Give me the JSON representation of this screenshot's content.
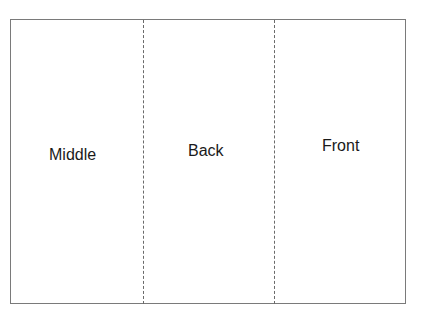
{
  "diagram": {
    "title": "",
    "panels": [
      {
        "label": "Middle"
      },
      {
        "label": "Back"
      },
      {
        "label": "Front"
      }
    ],
    "fold_lines": 2,
    "colors": {
      "frame": "#7a7a7a",
      "fold_line": "#6a6a6a",
      "text": "#1a1a1a",
      "background": "#ffffff"
    }
  }
}
